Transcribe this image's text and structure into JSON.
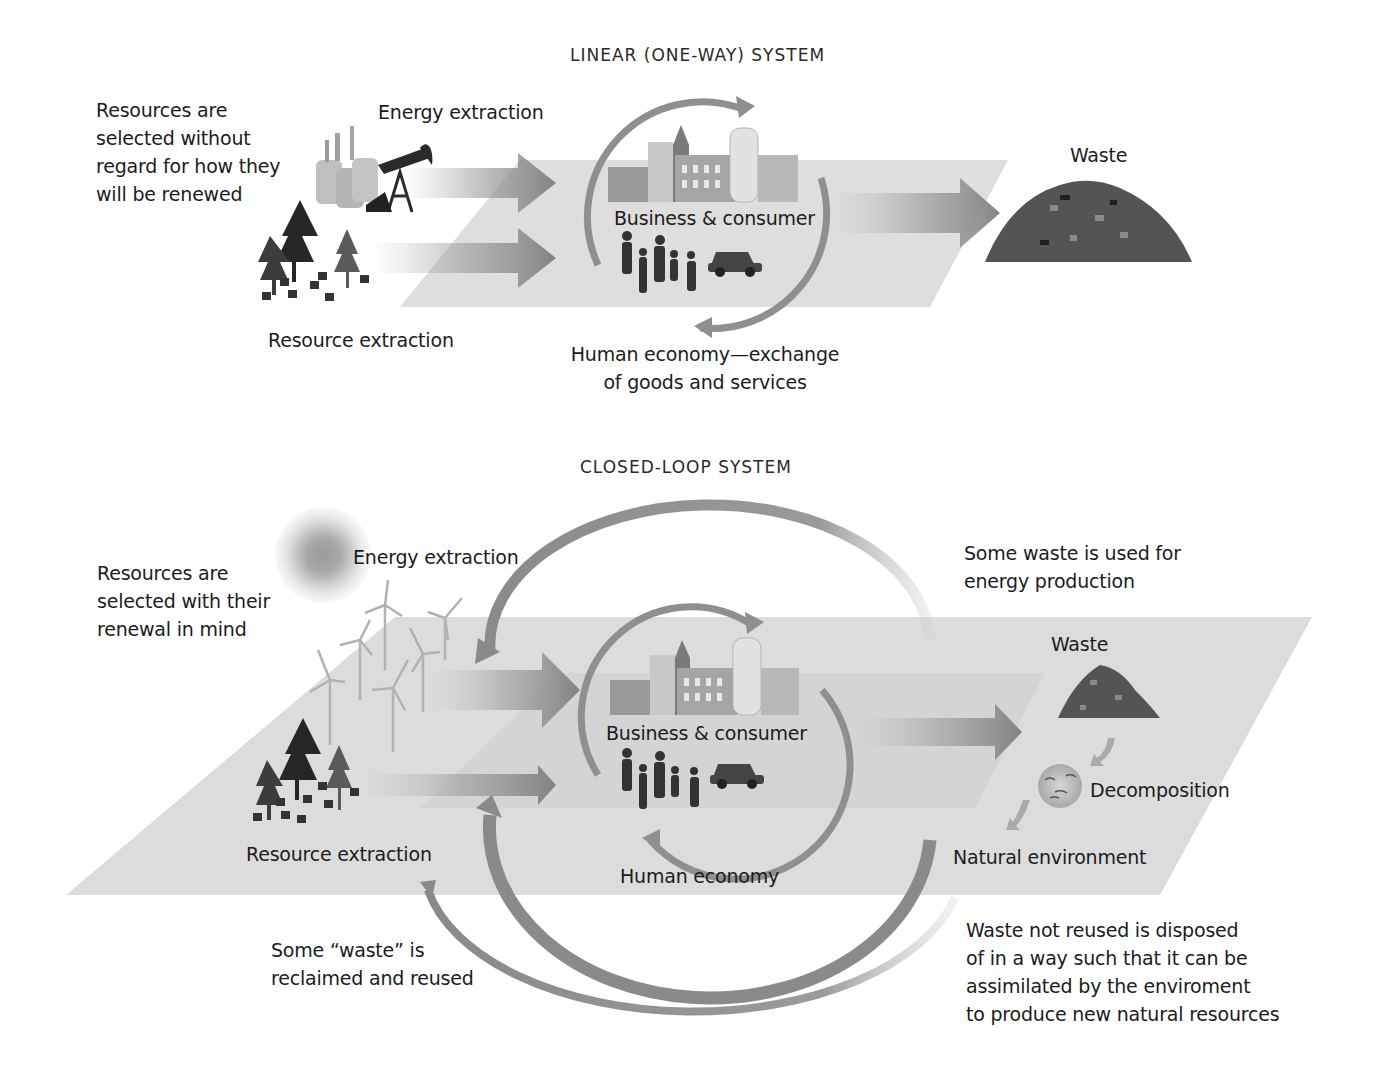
{
  "linear_system": {
    "title": "LINEAR (ONE-WAY) SYSTEM",
    "note_resources": [
      "Resources are",
      "selected without",
      "regard for how they",
      "will be renewed"
    ],
    "energy_extraction": "Energy extraction",
    "resource_extraction": "Resource extraction",
    "business_consumer": "Business & consumer",
    "human_economy": [
      "Human economy—exchange",
      "of goods and services"
    ],
    "waste": "Waste"
  },
  "closed_loop_system": {
    "title": "CLOSED-LOOP SYSTEM",
    "note_resources": [
      "Resources are",
      "selected with their",
      "renewal in mind"
    ],
    "energy_extraction": "Energy extraction",
    "resource_extraction": "Resource extraction",
    "business_consumer": "Business & consumer",
    "human_economy": "Human economy",
    "waste_energy_note": [
      "Some waste is used for",
      "energy production"
    ],
    "waste": "Waste",
    "decomposition": "Decomposition",
    "natural_environment": "Natural environment",
    "reclaimed_note": [
      "Some “waste” is",
      "reclaimed and reused"
    ],
    "disposal_note": [
      "Waste not reused is disposed",
      "of in a way such that it can be",
      "assimilated by the enviroment",
      "to produce new natural resources"
    ]
  },
  "colors": {
    "plane": "#dcdcdc",
    "arrow": "#8c8c8c",
    "cycle_arrow": "#909090",
    "building": "#a9a9a9",
    "tree": "#3a3a3a",
    "waste_pile": "#555555",
    "text": "#1c1c1c"
  }
}
